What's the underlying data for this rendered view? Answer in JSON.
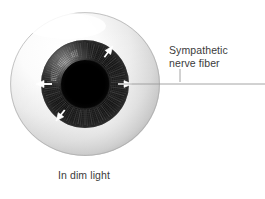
{
  "figure": {
    "type": "anatomical-diagram",
    "background_color": "#ffffff"
  },
  "caption": {
    "text": "In dim light"
  },
  "callout": {
    "line1": "Sympathetic",
    "line2": "nerve fiber",
    "text": "Sympathetic nerve fiber"
  },
  "eye": {
    "sclera": {
      "name": "sclera",
      "center_x": 85,
      "center_y": 84,
      "radius_x": 75,
      "radius_y": 72,
      "highlight_color": "#ffffff",
      "mid_color": "#d8d8d8",
      "edge_color": "#a8a8a8"
    },
    "iris": {
      "name": "iris",
      "center_x": 85,
      "center_y": 84,
      "radius": 44,
      "color": "#171717",
      "fiber_count": 108,
      "highlight_fiber_color": "#cfcfcf"
    },
    "pupil": {
      "name": "pupil",
      "center_x": 85,
      "center_y": 84,
      "radius": 24,
      "color": "#000000",
      "state": "dilated",
      "ring_count": 7
    },
    "arrows": {
      "name": "dilation-arrows",
      "direction": "outward",
      "color": "#ffffff",
      "count": 4,
      "angles_deg": [
        180,
        310,
        0,
        55
      ]
    }
  },
  "leader": {
    "name": "leader-line",
    "color": "#9a9a9a",
    "x_start": 118,
    "x_end": 265,
    "y": 84,
    "tick_x": 180,
    "tick_y_top": 69,
    "tick_y_bottom": 82
  },
  "colors": {
    "text": "#3b3b3b",
    "leader": "#9a9a9a",
    "background": "#ffffff"
  }
}
